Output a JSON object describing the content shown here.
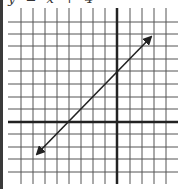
{
  "caption": "y = x + 4",
  "diagram": {
    "type": "coordinate-grid-line-graph",
    "grid": {
      "x_lines": [
        21,
        33,
        45,
        57,
        69,
        81,
        93,
        105,
        130,
        142,
        154,
        166
      ],
      "y_lines": [
        22,
        34,
        46,
        59,
        71,
        84,
        97,
        109,
        134,
        147,
        159,
        172
      ],
      "x_axis_y": 122,
      "y_axis_x": 117,
      "left": 8,
      "right": 178,
      "top": 8,
      "bottom": 184
    },
    "line": {
      "equation": "y = x + 4",
      "slope": 1,
      "y_intercept": 4,
      "x_intercept": -4,
      "start": [
        37,
        154
      ],
      "end": [
        151,
        37
      ],
      "arrows": "both"
    },
    "colors": {
      "grid": "#555555",
      "axis": "#222222",
      "line": "#222222"
    }
  }
}
